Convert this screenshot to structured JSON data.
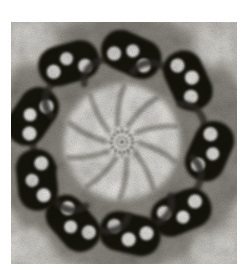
{
  "figure": {
    "canvas": {
      "width": 242,
      "height": 273,
      "background": "#ffffff"
    },
    "photo": {
      "x": 11,
      "y": 22,
      "width": 226,
      "height": 242,
      "base_color": "#d7d3cc"
    },
    "colors": {
      "ring_band": "#575249",
      "interior": "#f4f3ee",
      "blob": "#17120d",
      "lumen": "#f7f6f2",
      "tail": "#332f29",
      "spoke": "#8e8a82",
      "hub": "#5f5b54",
      "corner_light": "#edebe6"
    },
    "structure": {
      "center": {
        "x": 122,
        "y": 142
      },
      "ring_band_radius": 88,
      "ring_band_width": 82,
      "interior_radius": 58,
      "blob_length": 62,
      "blob_width": 40,
      "blob_corner_radius": 19,
      "blob_tilt_deg": 18,
      "triplets": [
        {
          "angle_deg": -164,
          "radius": 93,
          "dots": [
            [
              -16,
              7,
              7
            ],
            [
              0,
              -3,
              6.5
            ],
            [
              16,
              6,
              7
            ]
          ]
        },
        {
          "angle_deg": -124,
          "radius": 95,
          "dots": [
            [
              -17,
              4,
              7
            ],
            [
              -1,
              -5,
              6.5
            ],
            [
              15,
              7,
              7
            ]
          ]
        },
        {
          "angle_deg": -84,
          "radius": 88,
          "dots": [
            [
              -16,
              6,
              7
            ],
            [
              0,
              -4,
              6.5
            ],
            [
              16,
              5,
              7
            ]
          ]
        },
        {
          "angle_deg": -43,
          "radius": 90,
          "dots": [
            [
              -18,
              3,
              7
            ],
            [
              -1,
              -5,
              7
            ],
            [
              16,
              4,
              7
            ]
          ]
        },
        {
          "angle_deg": 6,
          "radius": 88,
          "dots": [
            [
              -16,
              6,
              7
            ],
            [
              1,
              -4,
              6.5
            ],
            [
              17,
              5,
              7
            ]
          ]
        },
        {
          "angle_deg": 50,
          "radius": 92,
          "dots": [
            [
              -17,
              5,
              7
            ],
            [
              0,
              -5,
              6.5
            ],
            [
              16,
              6,
              7
            ]
          ]
        },
        {
          "angle_deg": 85,
          "radius": 92,
          "dots": [
            [
              -16,
              4,
              7
            ],
            [
              0,
              -6,
              7
            ],
            [
              17,
              4,
              7
            ]
          ]
        },
        {
          "angle_deg": 121,
          "radius": 95,
          "dots": [
            [
              -17,
              6,
              7
            ],
            [
              -1,
              -4,
              6.5
            ],
            [
              15,
              6,
              7
            ]
          ]
        },
        {
          "angle_deg": 156,
          "radius": 93,
          "dots": [
            [
              -16,
              5,
              7
            ],
            [
              0,
              -5,
              6.5
            ],
            [
              16,
              6,
              7
            ]
          ]
        }
      ],
      "spokes": {
        "count": 10,
        "start_angle_deg": 3,
        "inner_radius": 18,
        "outer_radius": 56,
        "swirl_deg": 17,
        "width": 5.5
      },
      "hub": {
        "outer_radius": 10.5,
        "inner_radius": 5,
        "tick_count": 12,
        "tick_inner": 11.5,
        "tick_outer": 15.5
      },
      "corner_patches": [
        {
          "x": 32,
          "y": 44,
          "rx": 27,
          "ry": 21
        },
        {
          "x": 214,
          "y": 48,
          "rx": 22,
          "ry": 18
        },
        {
          "x": 26,
          "y": 246,
          "rx": 25,
          "ry": 19
        },
        {
          "x": 216,
          "y": 250,
          "rx": 25,
          "ry": 19
        }
      ]
    }
  }
}
